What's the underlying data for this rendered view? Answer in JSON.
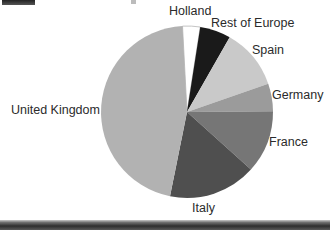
{
  "page": {
    "background": "#ffffff"
  },
  "chart_data": {
    "type": "pie",
    "title": "",
    "legend_position": "labels-around-pie",
    "center": {
      "x": 187,
      "y": 112
    },
    "radius": 86,
    "start_angle_deg": 357,
    "categories": [
      "Holland",
      "Rest of Europe",
      "Spain",
      "Germany",
      "France",
      "Italy",
      "United Kingdom"
    ],
    "values_pct": [
      3.3,
      5.8,
      11.4,
      5.2,
      11.8,
      16.5,
      46.0
    ],
    "slices": [
      {
        "label": "Holland",
        "value_pct": 3.3,
        "color": "#ffffff",
        "outline": "#aaaaaa"
      },
      {
        "label": "Rest of Europe",
        "value_pct": 5.8,
        "color": "#1a1a1a"
      },
      {
        "label": "Spain",
        "value_pct": 11.4,
        "color": "#c9c9c9"
      },
      {
        "label": "Germany",
        "value_pct": 5.2,
        "color": "#9b9b9b"
      },
      {
        "label": "France",
        "value_pct": 11.8,
        "color": "#767676"
      },
      {
        "label": "Italy",
        "value_pct": 16.5,
        "color": "#4f4f4f"
      },
      {
        "label": "United Kingdom",
        "value_pct": 46.0,
        "color": "#b2b2b2"
      }
    ],
    "label_color": "#2b2b2b"
  },
  "decor": {
    "top_left_bar": {
      "color_top": "#222222",
      "color_bottom": "#555555"
    },
    "top_center_tick": {
      "color": "#bcbcbc"
    },
    "bottom_bar": {
      "color_top": "#c8c8c8",
      "color_upper": "#6e6e6e",
      "color_mid": "#2e2e2e",
      "color_bottom": "#5a5a5a"
    }
  }
}
